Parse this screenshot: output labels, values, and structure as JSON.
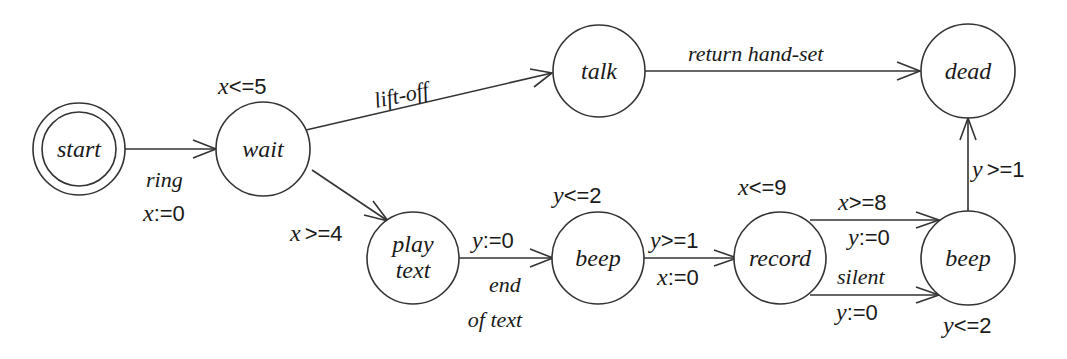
{
  "diagram": {
    "type": "timed-automaton",
    "states": [
      {
        "id": "start",
        "label": "start",
        "initial": true
      },
      {
        "id": "wait",
        "label": "wait",
        "invariant": "x<=5"
      },
      {
        "id": "talk",
        "label": "talk"
      },
      {
        "id": "dead",
        "label": "dead"
      },
      {
        "id": "play_text",
        "label_line1": "play",
        "label_line2": "text"
      },
      {
        "id": "beep1",
        "label": "beep",
        "invariant": "y<=2"
      },
      {
        "id": "record",
        "label": "record",
        "invariant": "x<=9"
      },
      {
        "id": "beep2",
        "label": "beep",
        "invariant": "y<=2"
      }
    ],
    "invariants": {
      "wait": {
        "var": "x",
        "op": "<=5"
      },
      "beep1": {
        "var": "y",
        "op": "<=2"
      },
      "record": {
        "var": "x",
        "op": "<=9"
      },
      "beep2": {
        "var": "y",
        "op": "<=2"
      }
    },
    "transitions": {
      "start_wait": {
        "action": "ring",
        "reset_var": "x",
        "reset_op": ":=0"
      },
      "wait_talk": {
        "action": "lift-off"
      },
      "talk_dead": {
        "action": "return hand-set"
      },
      "wait_play": {
        "guard_var": "x",
        "guard_op": ">=4"
      },
      "play_beep1": {
        "reset_var": "y",
        "reset_op": ":=0",
        "action_line1": "end",
        "action_line2": "of text"
      },
      "beep1_record": {
        "guard_var": "y",
        "guard_op": ">=1",
        "reset_var": "x",
        "reset_op": ":=0"
      },
      "record_beep2_top": {
        "guard_var": "x",
        "guard_op": ">=8",
        "reset_var": "y",
        "reset_op": ":=0"
      },
      "record_beep2_bottom": {
        "action": "silent",
        "reset_var": "y",
        "reset_op": ":=0"
      },
      "beep2_dead": {
        "guard_var": "y",
        "guard_op": ">=1"
      }
    }
  }
}
